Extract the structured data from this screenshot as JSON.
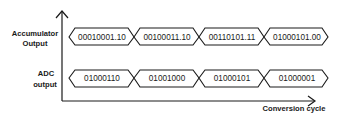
{
  "diagram": {
    "y_axis_labels": {
      "accumulator": [
        "Accumulator",
        "Output"
      ],
      "adc": [
        "ADC",
        "output"
      ]
    },
    "x_axis_label": "Conversion cycle",
    "rows": [
      {
        "name": "Accumulator Output",
        "cells": [
          "00010001.10",
          "00100011.10",
          "00110101.11",
          "01000101.00"
        ]
      },
      {
        "name": "ADC output",
        "cells": [
          "01000110",
          "01001000",
          "01000101",
          "01000001"
        ]
      }
    ],
    "colors": {
      "stroke": "#1a1a1a",
      "background": "#ffffff"
    }
  }
}
